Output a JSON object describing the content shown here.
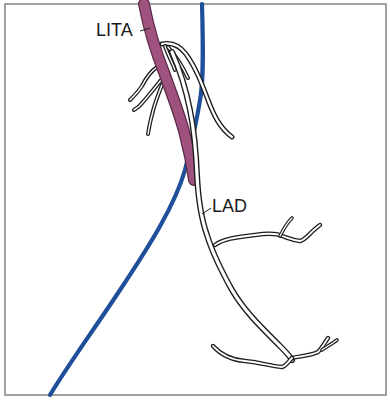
{
  "figure": {
    "type": "anatomical illustration",
    "labels": {
      "lita": "LITA",
      "lad": "LAD"
    },
    "colors": {
      "lita_artery": "#a0527e",
      "lita_outline": "#5a2a47",
      "interventricular_line": "#1f4f9a",
      "vessel_outline": "#1e1e1e",
      "frame": "#8a8a8a",
      "background": "#ffffff"
    }
  }
}
